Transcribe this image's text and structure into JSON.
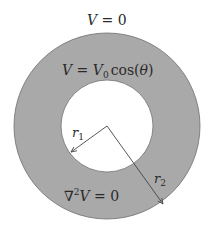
{
  "diagram": {
    "colors": {
      "annulus_fill": "#a9a9a9",
      "annulus_edge": "#6e6e6e",
      "inner_fill": "#ffffff",
      "arrow": "#444444",
      "text": "#2a2a2a"
    },
    "geometry": {
      "center": [
        107,
        126
      ],
      "outer_radius": 93,
      "inner_radius": 46
    },
    "labels": {
      "outer_boundary": {
        "V": "V",
        "eq": " = 0"
      },
      "inner_boundary": {
        "V": "V",
        "eq": " = ",
        "V0": "V",
        "sub0": "0",
        "cos": "cos(",
        "theta": "θ",
        "close": ")"
      },
      "laplace": {
        "nabla": "∇",
        "sup2": "2",
        "V": "V",
        "eq": " = 0"
      },
      "r1": {
        "r": "r",
        "sub": "1"
      },
      "r2": {
        "r": "r",
        "sub": "2"
      }
    },
    "arrows": [
      {
        "name": "r1",
        "from": [
          107,
          126
        ],
        "to": [
          71,
          152
        ]
      },
      {
        "name": "r2",
        "from": [
          107,
          126
        ],
        "to": [
          163,
          204
        ]
      }
    ]
  }
}
